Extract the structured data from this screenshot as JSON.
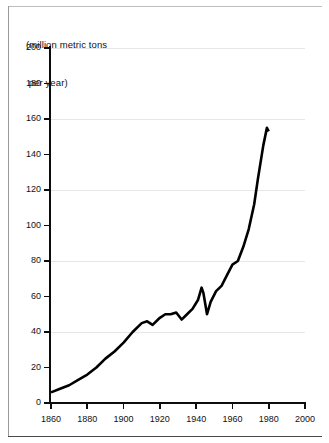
{
  "figure": {
    "caption_line1": "(million metric tons",
    "caption_line2": " per year)"
  },
  "chart_data": {
    "type": "line",
    "title": "",
    "subtitle": "",
    "axis_note": "(million metric tons per year)",
    "xlabel": "",
    "ylabel": "(million metric tons per year)",
    "xlim": [
      1860,
      2000
    ],
    "ylim": [
      0,
      200
    ],
    "xticks": [
      1860,
      1880,
      1900,
      1920,
      1940,
      1960,
      1980,
      2000
    ],
    "xtick_labels": [
      "1860",
      "1880",
      "1900",
      "1920",
      "1940",
      "1960",
      "1980",
      "2000"
    ],
    "yticks": [
      0,
      20,
      40,
      60,
      80,
      100,
      120,
      140,
      160,
      180,
      200
    ],
    "ytick_labels": [
      "0",
      "20",
      "40",
      "60",
      "80",
      "100",
      "120",
      "140",
      "160",
      "180",
      "200"
    ],
    "gridlines_y": [
      40,
      80,
      120,
      160,
      200
    ],
    "grid": "horizontal-major",
    "legend": "none",
    "line_color": "#000000",
    "grid_color": "#e6e6e6",
    "axis_color": "#0d0d0d",
    "series": [
      {
        "name": "production",
        "x": [
          1860,
          1865,
          1870,
          1875,
          1880,
          1885,
          1890,
          1895,
          1900,
          1905,
          1910,
          1913,
          1916,
          1920,
          1923,
          1926,
          1929,
          1932,
          1935,
          1938,
          1941,
          1943,
          1944,
          1946,
          1948,
          1951,
          1954,
          1957,
          1960,
          1963,
          1966,
          1969,
          1972,
          1974,
          1977,
          1979,
          1980
        ],
        "y": [
          6,
          8,
          10,
          13,
          16,
          20,
          25,
          29,
          34,
          40,
          45,
          46,
          44,
          48,
          50,
          50,
          51,
          47,
          50,
          53,
          58,
          65,
          62,
          50,
          57,
          63,
          66,
          72,
          78,
          80,
          88,
          98,
          112,
          126,
          145,
          155,
          153
        ]
      }
    ]
  }
}
